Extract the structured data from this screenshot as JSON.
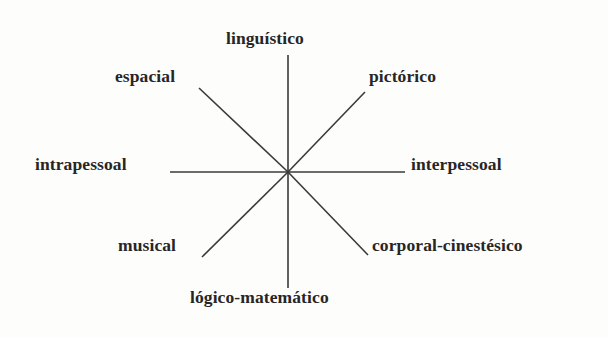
{
  "figure": {
    "type": "radial-spoke-diagram",
    "background_color": "#fdfdfb",
    "line_color": "#3a3a3a",
    "text_color": "#262626",
    "center": {
      "x": 288,
      "y": 172
    },
    "spoke_count": 8
  },
  "labels": {
    "top": "linguístico",
    "top_left": "espacial",
    "top_right": "pictórico",
    "left": "intrapessoal",
    "right": "interpessoal",
    "bottom_left": "musical",
    "bottom_right": "corporal-cinestésico",
    "bottom": "lógico-matemático"
  },
  "chart_data": {
    "type": "radial-spoke-diagram",
    "title": "",
    "subtitle": "",
    "xlabel": "",
    "ylabel": "",
    "grid": false,
    "legend": "none",
    "center": {
      "x": 288,
      "y": 172
    },
    "categories": [
      "linguístico",
      "pictórico",
      "interpessoal",
      "corporal-cinestésico",
      "lógico-matemático",
      "musical",
      "intrapessoal",
      "espacial"
    ],
    "angles_deg": [
      90,
      45,
      0,
      315,
      270,
      225,
      180,
      135
    ],
    "spokes": [
      {
        "label": "linguístico",
        "direction": "top",
        "x1": 288,
        "y1": 172,
        "x2": 288,
        "y2": 55
      },
      {
        "label": "pictórico",
        "direction": "top-right",
        "x1": 288,
        "y1": 172,
        "x2": 365,
        "y2": 92
      },
      {
        "label": "interpessoal",
        "direction": "right",
        "x1": 288,
        "y1": 172,
        "x2": 405,
        "y2": 172
      },
      {
        "label": "corporal-cinestésico",
        "direction": "bottom-right",
        "x1": 288,
        "y1": 172,
        "x2": 368,
        "y2": 255
      },
      {
        "label": "lógico-matemático",
        "direction": "bottom",
        "x1": 288,
        "y1": 172,
        "x2": 288,
        "y2": 288
      },
      {
        "label": "musical",
        "direction": "bottom-left",
        "x1": 288,
        "y1": 172,
        "x2": 202,
        "y2": 257
      },
      {
        "label": "intrapessoal",
        "direction": "left",
        "x1": 288,
        "y1": 172,
        "x2": 170,
        "y2": 172
      },
      {
        "label": "espacial",
        "direction": "top-left",
        "x1": 288,
        "y1": 172,
        "x2": 199,
        "y2": 88
      }
    ]
  }
}
